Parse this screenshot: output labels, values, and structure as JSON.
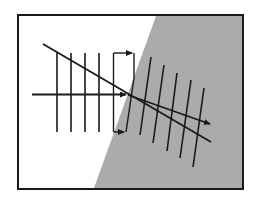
{
  "diagram": {
    "title": "",
    "colors": {
      "background": "#ffffff",
      "medium_2_fill": "#ababab",
      "stroke": "#1a1a1a"
    },
    "elements": {
      "frame": "frame",
      "interface": "interface between media",
      "medium_1": "upper-left medium (white)",
      "medium_2": "lower-right medium (gray)",
      "incident_wavefronts_count": 4,
      "refracted_wavefronts_count": 5,
      "rays": [
        "incident ray (horizontal)",
        "refracted ray",
        "straight-through reference line"
      ],
      "bracket": "wavefront transition bracket with arrows"
    }
  }
}
